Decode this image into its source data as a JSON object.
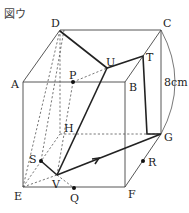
{
  "figure": {
    "title": "図ウ",
    "dimension_label": "8cm",
    "vertices": {
      "A": "A",
      "B": "B",
      "C": "C",
      "D": "D",
      "E": "E",
      "F": "F",
      "G": "G",
      "H": "H"
    },
    "points": {
      "P": "P",
      "Q": "Q",
      "R": "R",
      "S": "S",
      "T": "T",
      "U": "U",
      "V": "V"
    },
    "colors": {
      "line": "#444444",
      "path": "#222222",
      "hidden": "#555555"
    }
  }
}
